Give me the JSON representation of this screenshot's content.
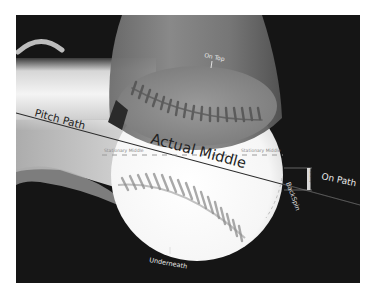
{
  "diagram": {
    "colors": {
      "page_background": "#ffffff",
      "panel_background": "#151515",
      "ball_white": "#fbfbfb",
      "bat_gray": "#8a8a8a",
      "seam_gray": "#6b6b6b",
      "line_dark": "#2a2a2a",
      "label_light": "#e8e8e8"
    },
    "labels": {
      "pitch_path": "Pitch Path",
      "actual_middle": "Actual Middle",
      "stationary_middle_left": "Stationary Middle",
      "stationary_middle_right": "Stationary Middle",
      "on_top": "On Top",
      "underneath": "Underneath",
      "backspin": "BackSpin",
      "on_path": "On Path",
      "bracket_label": "Stationary"
    }
  }
}
